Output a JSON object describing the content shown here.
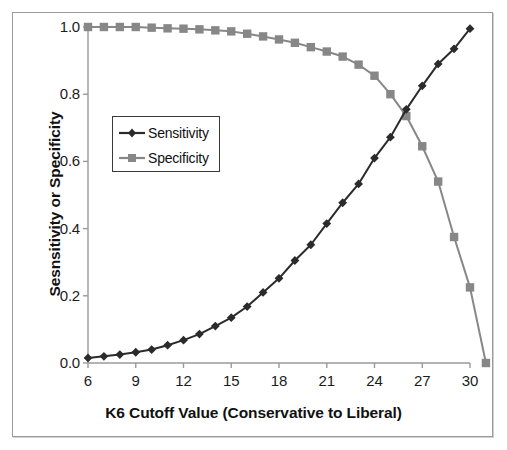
{
  "chart_data": {
    "type": "line",
    "title": "",
    "xlabel": "K6 Cutoff Value (Conservative to Liberal)",
    "ylabel": "Sesnsitivity or Specificity",
    "xlim": [
      6,
      30
    ],
    "ylim": [
      0.0,
      1.0
    ],
    "grid": false,
    "legend_position": "upper-left-inside",
    "x": [
      6,
      7,
      8,
      9,
      10,
      11,
      12,
      13,
      14,
      15,
      16,
      17,
      18,
      19,
      20,
      21,
      22,
      23,
      24,
      25,
      26,
      27,
      28,
      29,
      30
    ],
    "xticks": [
      "6",
      "9",
      "12",
      "15",
      "18",
      "21",
      "24",
      "27",
      "30"
    ],
    "xtick_values": [
      6,
      9,
      12,
      15,
      18,
      21,
      24,
      27,
      30
    ],
    "yticks": [
      "0.0",
      "0.2",
      "0.4",
      "0.6",
      "0.8",
      "1.0"
    ],
    "ytick_values": [
      0.0,
      0.2,
      0.4,
      0.6,
      0.8,
      1.0
    ],
    "series": [
      {
        "name": "Sensitivity",
        "marker": "diamond",
        "color": "#2b2b2b",
        "values": [
          0.015,
          0.02,
          0.025,
          0.032,
          0.04,
          0.053,
          0.068,
          0.086,
          0.11,
          0.135,
          0.168,
          0.21,
          0.252,
          0.305,
          0.352,
          0.415,
          0.477,
          0.533,
          0.61,
          0.672,
          0.755,
          0.825,
          0.89,
          0.935,
          0.995
        ]
      },
      {
        "name": "Specificity",
        "marker": "square",
        "color": "#878787",
        "values": [
          1.0,
          1.0,
          1.0,
          1.0,
          0.998,
          0.996,
          0.995,
          0.993,
          0.99,
          0.987,
          0.98,
          0.972,
          0.963,
          0.953,
          0.94,
          0.927,
          0.912,
          0.888,
          0.855,
          0.8,
          0.735,
          0.645,
          0.54,
          0.375,
          0.225
        ]
      }
    ]
  },
  "legend": {
    "entries": [
      {
        "label": "Sensitivity"
      },
      {
        "label": "Specificity"
      }
    ]
  },
  "axes": {
    "x_title": "K6 Cutoff Value (Conservative to Liberal)",
    "y_title": "Sesnsitivity or Specificity"
  },
  "colors": {
    "sensitivity": "#2b2b2b",
    "specificity": "#878787",
    "axis": "#9a9a9a",
    "text": "#111111",
    "frame": "#9a9a9a",
    "background": "#ffffff"
  }
}
